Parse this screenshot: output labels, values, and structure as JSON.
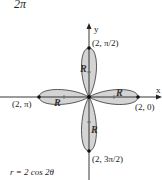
{
  "top_fragment": "2π",
  "axes": {
    "x_label": "x",
    "y_label": "y"
  },
  "points": {
    "top": "(2, π/2)",
    "right": "(2, 0)",
    "left": "(2, π)",
    "bottom": "(2, 3π/2)"
  },
  "region_labels": {
    "top": "R",
    "right": "R",
    "left": "R",
    "bottom": "R"
  },
  "equation": "r = 2 cos 2θ",
  "colors": {
    "petal_fill": "#d4d4d4",
    "stroke": "#222222"
  }
}
